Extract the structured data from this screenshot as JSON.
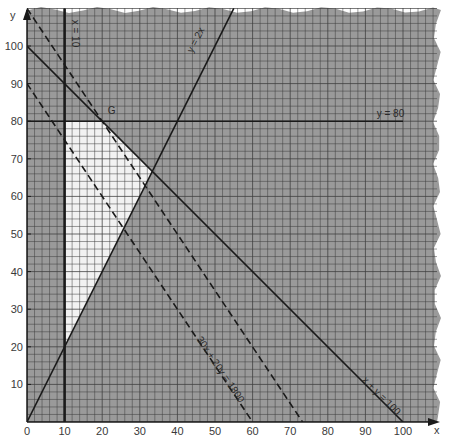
{
  "chart_data": {
    "type": "line",
    "title": "",
    "xlabel": "x",
    "ylabel": "y",
    "xlim": [
      0,
      110
    ],
    "ylim": [
      0,
      110
    ],
    "grid": true,
    "grid_minor_step": 2,
    "x_ticks": [
      0,
      10,
      20,
      30,
      40,
      50,
      60,
      70,
      80,
      90,
      100
    ],
    "y_ticks": [
      10,
      20,
      30,
      40,
      50,
      60,
      70,
      80,
      90,
      100
    ],
    "colors": {
      "shaded": "#9a9a9a",
      "feasible": "#f2f2f2",
      "grid": "#3d3d3d",
      "line": "#1a1a1a"
    },
    "series": [
      {
        "name": "x = 10",
        "style": "solid-bold",
        "points": [
          [
            10,
            0
          ],
          [
            10,
            110
          ]
        ],
        "label": "x = 10",
        "label_pos": [
          12,
          107
        ],
        "label_rotate": 90
      },
      {
        "name": "y = 80",
        "style": "solid",
        "points": [
          [
            0,
            80
          ],
          [
            100,
            80
          ]
        ],
        "label": "y = 80",
        "label_pos": [
          93,
          81
        ],
        "label_rotate": 0
      },
      {
        "name": "y = 2x",
        "style": "solid",
        "points": [
          [
            0,
            0
          ],
          [
            55,
            110
          ]
        ],
        "label": "y = 2x",
        "label_pos": [
          44,
          98
        ],
        "label_rotate": -63
      },
      {
        "name": "x + y = 100",
        "style": "solid",
        "points": [
          [
            0,
            100
          ],
          [
            100,
            0
          ]
        ],
        "label": "x + y = 100",
        "label_pos": [
          89,
          11
        ],
        "label_rotate": 45
      },
      {
        "name": "30x + 20y = 1800",
        "style": "dashed",
        "points": [
          [
            0,
            90
          ],
          [
            60,
            0
          ]
        ],
        "label": "30x + 20y = 1800",
        "label_pos": [
          45,
          22
        ],
        "label_rotate": 56
      },
      {
        "name": "30x + 20y = 2200",
        "style": "dashed",
        "points": [
          [
            0,
            110
          ],
          [
            73.3,
            0
          ]
        ],
        "label": "",
        "label_pos": null,
        "label_rotate": 56
      }
    ],
    "feasible_region": {
      "vertices": [
        [
          10,
          20
        ],
        [
          10,
          80
        ],
        [
          20,
          80
        ],
        [
          33.3,
          66.7
        ]
      ]
    },
    "annotations": [
      {
        "text": "G",
        "point": [
          20,
          80
        ],
        "label_pos": [
          21.5,
          82
        ]
      }
    ]
  }
}
